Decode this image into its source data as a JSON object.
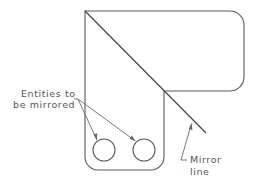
{
  "diagram": {
    "labels": {
      "entities_line1": "Entities to",
      "entities_line2": "be mirrored",
      "mirror_line1": "Mirror",
      "mirror_line2": "line"
    },
    "elements": {
      "part_outline": "L-shaped plate with rounded corners",
      "circles": [
        {
          "name": "hole-left",
          "cx": 104,
          "cy": 150,
          "r": 11
        },
        {
          "name": "hole-right",
          "cx": 144,
          "cy": 150,
          "r": 11
        }
      ],
      "mirror_line": {
        "x1": 85,
        "y1": 11,
        "x2": 206,
        "y2": 133
      }
    },
    "colors": {
      "stroke": "#5a5a5a",
      "text": "#555555",
      "background": "#ffffff"
    }
  }
}
